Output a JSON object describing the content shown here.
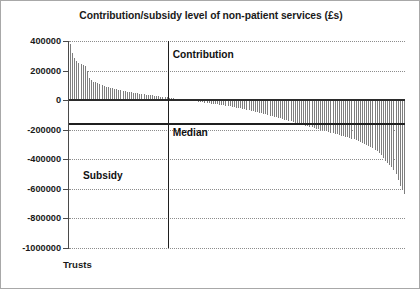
{
  "chart_data": {
    "type": "bar",
    "title": "Contribution/subsidy level of non-patient services (£s)",
    "xlabel": "Trusts",
    "ylabel": "",
    "ylim": [
      -1000000,
      400000
    ],
    "yticks": [
      400000,
      200000,
      0,
      -200000,
      -400000,
      -600000,
      -800000,
      -1000000
    ],
    "ytick_labels": [
      "400000",
      "200000",
      "0",
      "-200000",
      "-400000",
      "-600000",
      "-800000",
      "-1000000"
    ],
    "grid": true,
    "legend": "none",
    "bar_color": "#7e7e7e",
    "annotations": [
      {
        "text": "Contribution",
        "value": 300000
      },
      {
        "text": "Median",
        "value": -160000
      },
      {
        "text": "Subsidy",
        "value": -520000
      }
    ],
    "reference_lines": [
      {
        "name": "zero",
        "orientation": "horizontal",
        "value": 0
      },
      {
        "name": "median",
        "orientation": "horizontal",
        "value": -160000
      },
      {
        "name": "marker",
        "orientation": "vertical",
        "index": 47
      }
    ],
    "categories_label": "Trusts (sorted by contribution/subsidy level)",
    "values": [
      382000,
      318000,
      286000,
      268000,
      252000,
      243000,
      236000,
      228000,
      196000,
      150000,
      134000,
      126000,
      120000,
      114000,
      108000,
      102000,
      97000,
      92000,
      88000,
      84000,
      80000,
      76000,
      72000,
      69000,
      66000,
      63000,
      60000,
      57000,
      54000,
      52000,
      50000,
      48000,
      46000,
      44000,
      42000,
      40000,
      38000,
      36000,
      34000,
      32000,
      30000,
      28000,
      26000,
      24000,
      22000,
      20000,
      18000,
      16000,
      14000,
      12000,
      10000,
      8000,
      6000,
      4000,
      2000,
      1000,
      -1000,
      -3000,
      -5000,
      -7000,
      -9000,
      -11000,
      -13000,
      -15000,
      -17000,
      -19000,
      -21000,
      -23000,
      -25000,
      -27000,
      -29000,
      -31000,
      -33000,
      -35000,
      -37000,
      -39000,
      -41000,
      -44000,
      -47000,
      -50000,
      -53000,
      -56000,
      -59000,
      -62000,
      -65000,
      -68000,
      -71000,
      -74000,
      -77000,
      -80000,
      -84000,
      -88000,
      -92000,
      -96000,
      -100000,
      -104000,
      -108000,
      -112000,
      -116000,
      -120000,
      -124000,
      -128000,
      -132000,
      -136000,
      -140000,
      -144000,
      -148000,
      -152000,
      -156000,
      -160000,
      -164000,
      -168000,
      -172000,
      -176000,
      -180000,
      -184000,
      -188000,
      -192000,
      -196000,
      -200000,
      -204000,
      -208000,
      -212000,
      -216000,
      -220000,
      -224000,
      -228000,
      -232000,
      -236000,
      -240000,
      -244000,
      -248000,
      -252000,
      -256000,
      -260000,
      -266000,
      -272000,
      -278000,
      -284000,
      -290000,
      -296000,
      -302000,
      -310000,
      -318000,
      -326000,
      -334000,
      -344000,
      -356000,
      -372000,
      -392000,
      -412000,
      -428000,
      -440000,
      -452000,
      -470000,
      -500000,
      -540000,
      -580000,
      -610000,
      -638000
    ]
  }
}
